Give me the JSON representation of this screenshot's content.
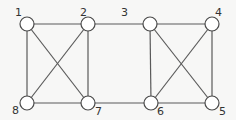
{
  "diagram": {
    "type": "graph",
    "nodes": [
      {
        "id": "1",
        "label": "1",
        "x": 27,
        "y": 24,
        "lx": 15,
        "ly": 16
      },
      {
        "id": "2",
        "label": "2",
        "x": 88,
        "y": 24,
        "lx": 80,
        "ly": 16
      },
      {
        "id": "3",
        "label": "3",
        "x": 150,
        "y": 24,
        "lx": 121,
        "ly": 16
      },
      {
        "id": "4",
        "label": "4",
        "x": 212,
        "y": 24,
        "lx": 215,
        "ly": 16
      },
      {
        "id": "5",
        "label": "5",
        "x": 212,
        "y": 103,
        "lx": 219,
        "ly": 115
      },
      {
        "id": "6",
        "label": "6",
        "x": 151,
        "y": 103,
        "lx": 157,
        "ly": 115
      },
      {
        "id": "7",
        "label": "7",
        "x": 88,
        "y": 103,
        "lx": 95,
        "ly": 115
      },
      {
        "id": "8",
        "label": "8",
        "x": 27,
        "y": 103,
        "lx": 12,
        "ly": 114
      }
    ],
    "edges": [
      [
        "1",
        "2"
      ],
      [
        "2",
        "3"
      ],
      [
        "3",
        "4"
      ],
      [
        "1",
        "8"
      ],
      [
        "2",
        "7"
      ],
      [
        "1",
        "7"
      ],
      [
        "2",
        "8"
      ],
      [
        "8",
        "7"
      ],
      [
        "7",
        "6"
      ],
      [
        "6",
        "5"
      ],
      [
        "3",
        "6"
      ],
      [
        "3",
        "5"
      ],
      [
        "4",
        "6"
      ],
      [
        "4",
        "5"
      ]
    ],
    "node_radius": 7
  }
}
